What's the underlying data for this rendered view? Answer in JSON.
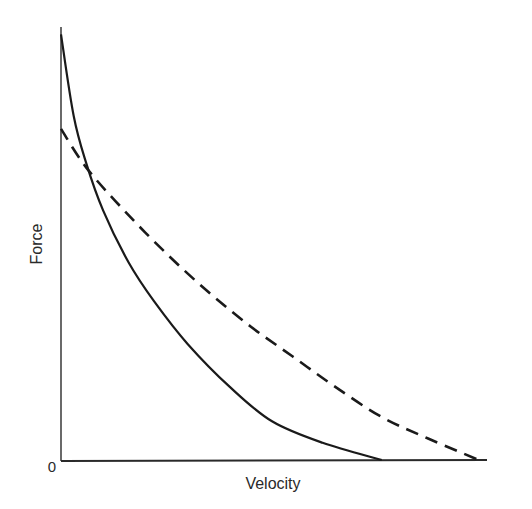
{
  "chart_data": {
    "type": "line",
    "title": "",
    "xlabel": "Velocity",
    "ylabel": "Force",
    "x_tick_labels": [],
    "y_tick_labels": [
      "0"
    ],
    "origin_label": "0",
    "grid": false,
    "legend": null,
    "units": "arbitrary (normalized 0–1 on both axes)",
    "xlim": [
      0,
      1
    ],
    "ylim": [
      0,
      1
    ],
    "series": [
      {
        "name": "solid curve",
        "style": "solid",
        "color": "#1a1a1a",
        "x": [
          0.0,
          0.03,
          0.06,
          0.1,
          0.16,
          0.22,
          0.3,
          0.4,
          0.5,
          0.62,
          0.76
        ],
        "y": [
          0.99,
          0.8,
          0.69,
          0.58,
          0.46,
          0.37,
          0.27,
          0.17,
          0.09,
          0.04,
          0.0
        ]
      },
      {
        "name": "dashed curve",
        "style": "dashed",
        "color": "#1a1a1a",
        "x": [
          0.0,
          0.06,
          0.15,
          0.25,
          0.35,
          0.45,
          0.55,
          0.65,
          0.76,
          0.87,
          0.99
        ],
        "y": [
          0.77,
          0.68,
          0.58,
          0.48,
          0.39,
          0.31,
          0.24,
          0.17,
          0.1,
          0.05,
          0.0
        ]
      }
    ]
  },
  "labels": {
    "x_axis": "Velocity",
    "y_axis": "Force",
    "origin": "0"
  }
}
